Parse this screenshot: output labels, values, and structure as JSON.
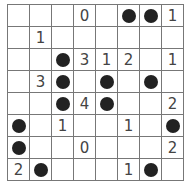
{
  "puzzle": {
    "type": "light-up",
    "size": 8,
    "legend": {
      "bulb": "●",
      "number": "clue",
      "empty": ""
    },
    "cells": [
      [
        "",
        "",
        "",
        "0",
        "",
        "●",
        "●",
        "1"
      ],
      [
        "",
        "1",
        "",
        "",
        "",
        "",
        "",
        ""
      ],
      [
        "",
        "",
        "●",
        "3",
        "1",
        "2",
        "",
        "1"
      ],
      [
        "",
        "3",
        "●",
        "",
        "●",
        "",
        "●",
        ""
      ],
      [
        "",
        "",
        "●",
        "4",
        "●",
        "",
        "",
        "2"
      ],
      [
        "●",
        "",
        "1",
        "",
        "",
        "1",
        "",
        "●"
      ],
      [
        "●",
        "",
        "",
        "0",
        "",
        "",
        "",
        "2"
      ],
      [
        "2",
        "●",
        "",
        "",
        "",
        "1",
        "●",
        ""
      ]
    ]
  }
}
